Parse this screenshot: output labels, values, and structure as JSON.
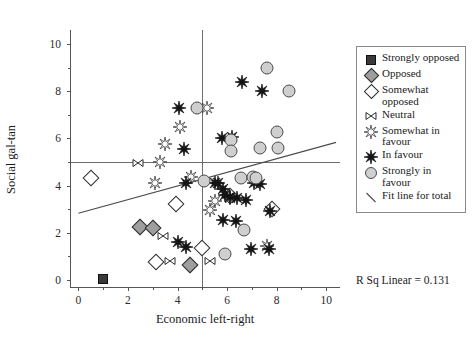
{
  "chart_data": {
    "type": "scatter",
    "title": "",
    "xlabel": "Economic left-right",
    "ylabel": "Social gal-tan",
    "xlim": [
      -0.3,
      10.6
    ],
    "ylim": [
      -0.35,
      10.6
    ],
    "xticks": [
      0,
      2,
      4,
      6,
      8,
      10
    ],
    "yticks": [
      0,
      2,
      4,
      6,
      8,
      10
    ],
    "xtick_labels": [
      "0",
      "2",
      "4",
      "6",
      "8",
      "10"
    ],
    "ytick_labels": [
      "0",
      "2",
      "4",
      "6",
      "8",
      "10"
    ],
    "grid": false,
    "minor_ticks": true,
    "legend_position": "outside-right-top",
    "annotation": "R Sq Linear = 0.131",
    "r_squared": 0.131,
    "reference_lines": [
      {
        "name": "vertical-midline",
        "axis": "x",
        "value": 5
      },
      {
        "name": "horizontal-midline",
        "axis": "y",
        "value": 5
      }
    ],
    "fit_line": {
      "name": "Fit line for total",
      "x_start": 0.0,
      "y_start": 2.82,
      "x_end": 10.4,
      "y_end": 5.83
    },
    "series": [
      {
        "name": "Strongly opposed",
        "marker": "filled-square",
        "points": [
          [
            1.0,
            0.05
          ]
        ]
      },
      {
        "name": "Opposed",
        "marker": "filled-diamond",
        "points": [
          [
            2.5,
            2.25
          ],
          [
            3.0,
            2.2
          ],
          [
            4.5,
            0.62
          ]
        ]
      },
      {
        "name": "Somewhat opposed",
        "marker": "open-diamond",
        "points": [
          [
            0.5,
            4.3
          ],
          [
            3.95,
            3.2
          ],
          [
            5.0,
            1.35
          ],
          [
            6.1,
            3.55
          ],
          [
            7.8,
            3.02
          ],
          [
            3.15,
            0.75
          ]
        ]
      },
      {
        "name": "Neutral",
        "marker": "bowtie",
        "points": [
          [
            2.4,
            4.95
          ],
          [
            3.4,
            1.85
          ],
          [
            3.7,
            0.8
          ],
          [
            5.3,
            0.8
          ]
        ]
      },
      {
        "name": "Somewhat in favour",
        "marker": "open-star",
        "points": [
          [
            3.5,
            5.75
          ],
          [
            3.3,
            5.0
          ],
          [
            4.1,
            6.5
          ],
          [
            5.2,
            7.3
          ],
          [
            4.55,
            4.35
          ],
          [
            3.1,
            4.1
          ],
          [
            5.5,
            3.35
          ],
          [
            5.3,
            2.95
          ],
          [
            6.1,
            3.45
          ],
          [
            7.6,
            1.45
          ]
        ]
      },
      {
        "name": "In favour",
        "marker": "filled-star",
        "points": [
          [
            4.05,
            7.3
          ],
          [
            6.6,
            8.4
          ],
          [
            7.4,
            8.0
          ],
          [
            4.25,
            5.55
          ],
          [
            4.35,
            4.1
          ],
          [
            5.5,
            4.1
          ],
          [
            5.65,
            4.1
          ],
          [
            5.85,
            3.85
          ],
          [
            5.9,
            3.6
          ],
          [
            6.1,
            3.5
          ],
          [
            6.4,
            3.45
          ],
          [
            6.75,
            3.4
          ],
          [
            7.1,
            4.1
          ],
          [
            7.35,
            4.05
          ],
          [
            5.85,
            2.55
          ],
          [
            7.75,
            2.9
          ],
          [
            5.8,
            6.0
          ],
          [
            6.2,
            6.05
          ],
          [
            6.95,
            1.3
          ],
          [
            7.7,
            1.3
          ],
          [
            6.35,
            2.5
          ],
          [
            4.0,
            1.6
          ],
          [
            4.35,
            1.4
          ]
        ]
      },
      {
        "name": "Strongly in favour",
        "marker": "filled-circle",
        "points": [
          [
            4.8,
            7.3
          ],
          [
            7.6,
            9.0
          ],
          [
            8.5,
            8.0
          ],
          [
            6.15,
            5.95
          ],
          [
            6.15,
            5.45
          ],
          [
            7.35,
            5.6
          ],
          [
            8.05,
            5.6
          ],
          [
            8.0,
            6.25
          ],
          [
            6.55,
            4.3
          ],
          [
            7.05,
            4.35
          ],
          [
            7.15,
            4.3
          ],
          [
            5.9,
            1.1
          ],
          [
            6.7,
            2.1
          ],
          [
            5.05,
            4.2
          ]
        ]
      }
    ]
  },
  "legend": {
    "items": [
      {
        "label": "Strongly opposed",
        "symbol": "filled-square"
      },
      {
        "label": "Opposed",
        "symbol": "filled-diamond"
      },
      {
        "label": "Somewhat opposed",
        "symbol": "open-diamond"
      },
      {
        "label": "Neutral",
        "symbol": "bowtie"
      },
      {
        "label": "Somewhat in favour",
        "symbol": "open-star"
      },
      {
        "label": "In favour",
        "symbol": "filled-star"
      },
      {
        "label": "Strongly in favour",
        "symbol": "filled-circle"
      },
      {
        "label": "Fit line for total",
        "symbol": "line-segment"
      }
    ]
  },
  "colors": {
    "marker_fill_dark": "#3a3a3a",
    "marker_fill_mid": "#9e9e9e",
    "marker_fill_light": "#cfcfcf",
    "stroke": "#2b2b2b",
    "axis": "#555555",
    "reference_line": "#6e6e6e",
    "background": "#ffffff"
  }
}
